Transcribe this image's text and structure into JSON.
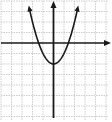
{
  "chart_data": {
    "type": "line",
    "title": "",
    "xlabel": "",
    "ylabel": "",
    "equation": "y = x^2 - 2",
    "xlim": [
      -5,
      5
    ],
    "ylim": [
      -7,
      3
    ],
    "grid": true,
    "x_axis_arrow": "right",
    "y_axis_arrow": "up",
    "vertex": [
      0,
      -2
    ],
    "x_intercepts": [
      -1.41,
      1.41
    ],
    "series": [
      {
        "name": "parabola",
        "x": [
          -2.3,
          -2,
          -1.5,
          -1,
          -0.5,
          0,
          0.5,
          1,
          1.5,
          2,
          2.3
        ],
        "y": [
          3.29,
          2,
          0.25,
          -1,
          -1.75,
          -2,
          -1.75,
          -1,
          0.25,
          2,
          3.29
        ]
      }
    ]
  },
  "colors": {
    "grid": "#b8b8b8",
    "axis": "#1a1a1a",
    "curve": "#1a1a1a",
    "background": "#ffffff"
  }
}
